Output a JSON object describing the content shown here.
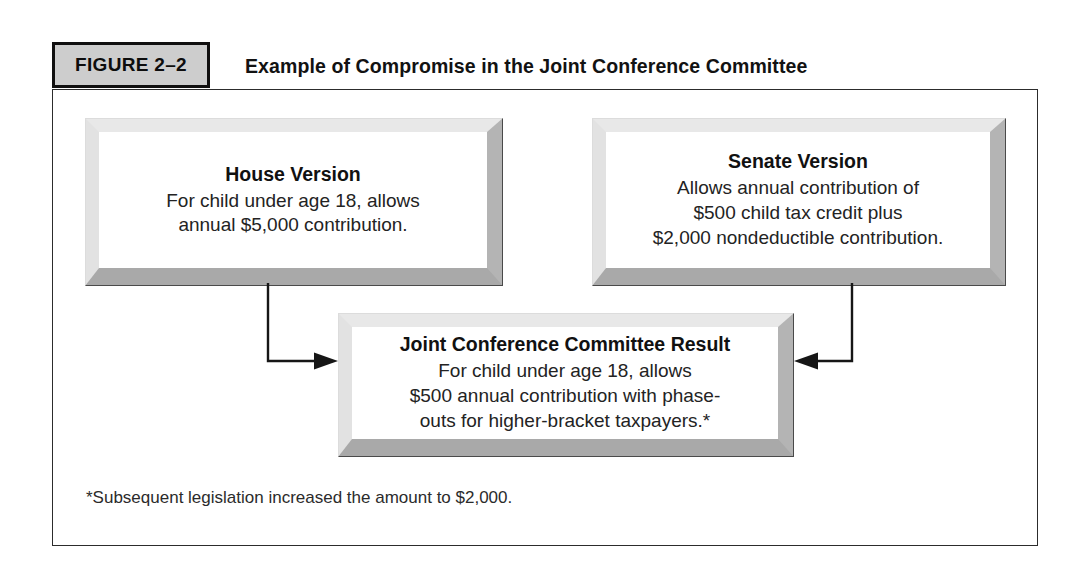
{
  "figure": {
    "badge_label": "FIGURE 2–2",
    "title": "Example of Compromise in the Joint Conference Committee",
    "footnote": "*Subsequent legislation increased the amount to $2,000.",
    "colors": {
      "badge_fill": "#cdcdcd",
      "badge_border": "#100f0f",
      "frame_border": "#2c2c2c",
      "box_face": "#ffffff",
      "bevel_light": "#e8e8e8",
      "bevel_dark": "#a9a9a9",
      "connector": "#161616",
      "text": "#1b1b1b"
    }
  },
  "nodes": {
    "house": {
      "title": "House Version",
      "line1": "For child under age 18, allows",
      "line2": "annual $5,000 contribution."
    },
    "senate": {
      "title": "Senate Version",
      "line1": "Allows annual contribution of",
      "line2": "$500 child tax credit plus",
      "line3": "$2,000 nondeductible contribution."
    },
    "result": {
      "title": "Joint Conference Committee Result",
      "line1": "For child under age 18, allows",
      "line2": "$500 annual contribution with phase-",
      "line3": "outs for higher-bracket taxpayers.*"
    }
  },
  "connectors": {
    "house_to_result": "elbow-arrow-right",
    "senate_to_result": "elbow-arrow-left"
  }
}
